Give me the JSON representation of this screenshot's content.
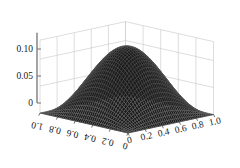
{
  "figure": {
    "kind": "surface-plot-3d",
    "background_color": "#ffffff",
    "width": 240,
    "height": 168
  },
  "chart_data": {
    "type": "surface",
    "title": "",
    "subtitle": "",
    "xlabel": "",
    "ylabel": "",
    "zlabel": "",
    "grid": true,
    "legend": "none",
    "xlim": [
      0,
      1
    ],
    "ylim": [
      0,
      1
    ],
    "zlim": [
      0,
      0.125
    ],
    "x_ticks": [
      "0",
      "0.2",
      "0.4",
      "0.6",
      "0.8",
      "1.0"
    ],
    "x_tick_values": [
      0,
      0.2,
      0.4,
      0.6,
      0.8,
      1.0
    ],
    "y_ticks": [
      "1.0",
      "0.8",
      "0.6",
      "0.4",
      "0.2",
      "0"
    ],
    "y_tick_values": [
      1.0,
      0.8,
      0.6,
      0.4,
      0.2,
      0
    ],
    "z_ticks": [
      "0",
      "0.05",
      "0.10"
    ],
    "z_tick_values": [
      0,
      0.05,
      0.1
    ],
    "peak_value": 0.125,
    "peak_x": 0.5,
    "peak_y": 0.5,
    "boundary_value": 0,
    "surface_color": "#1c1c1c",
    "mesh_color": "#6e6e6e",
    "grid_color": "#cfcfcf",
    "axis_color": "#7d7d7d",
    "x": [
      0,
      0.05,
      0.1,
      0.15,
      0.2,
      0.25,
      0.3,
      0.35,
      0.4,
      0.45,
      0.5,
      0.55,
      0.6,
      0.65,
      0.7,
      0.75,
      0.8,
      0.85,
      0.9,
      0.95,
      1.0
    ],
    "y": [
      0,
      0.05,
      0.1,
      0.15,
      0.2,
      0.25,
      0.3,
      0.35,
      0.4,
      0.45,
      0.5,
      0.55,
      0.6,
      0.65,
      0.7,
      0.75,
      0.8,
      0.85,
      0.9,
      0.95,
      1.0
    ],
    "z_formula": "0.5 * sin(pi*x) * sin(pi*y) * 0.25",
    "z_rows": [
      [
        0,
        0,
        0,
        0,
        0,
        0,
        0,
        0,
        0,
        0,
        0,
        0,
        0,
        0,
        0,
        0,
        0,
        0,
        0,
        0,
        0
      ],
      [
        0,
        0.003,
        0.006,
        0.009,
        0.011,
        0.013,
        0.015,
        0.017,
        0.018,
        0.019,
        0.019,
        0.019,
        0.018,
        0.017,
        0.015,
        0.013,
        0.011,
        0.009,
        0.006,
        0.003,
        0
      ],
      [
        0,
        0.006,
        0.012,
        0.017,
        0.022,
        0.026,
        0.03,
        0.033,
        0.035,
        0.037,
        0.038,
        0.037,
        0.035,
        0.033,
        0.03,
        0.026,
        0.022,
        0.017,
        0.012,
        0.006,
        0
      ],
      [
        0,
        0.009,
        0.017,
        0.025,
        0.032,
        0.038,
        0.043,
        0.047,
        0.05,
        0.053,
        0.054,
        0.053,
        0.05,
        0.047,
        0.043,
        0.038,
        0.032,
        0.025,
        0.017,
        0.009,
        0
      ],
      [
        0,
        0.011,
        0.022,
        0.032,
        0.04,
        0.048,
        0.055,
        0.06,
        0.064,
        0.067,
        0.068,
        0.067,
        0.064,
        0.06,
        0.055,
        0.048,
        0.04,
        0.032,
        0.022,
        0.011,
        0
      ],
      [
        0,
        0.013,
        0.026,
        0.038,
        0.048,
        0.058,
        0.065,
        0.072,
        0.076,
        0.079,
        0.08,
        0.079,
        0.076,
        0.072,
        0.065,
        0.058,
        0.048,
        0.038,
        0.026,
        0.013,
        0
      ],
      [
        0,
        0.015,
        0.03,
        0.043,
        0.055,
        0.065,
        0.074,
        0.081,
        0.086,
        0.09,
        0.091,
        0.09,
        0.086,
        0.081,
        0.074,
        0.065,
        0.055,
        0.043,
        0.03,
        0.015,
        0
      ],
      [
        0,
        0.017,
        0.033,
        0.047,
        0.06,
        0.072,
        0.081,
        0.089,
        0.095,
        0.098,
        0.1,
        0.098,
        0.095,
        0.089,
        0.081,
        0.072,
        0.06,
        0.047,
        0.033,
        0.017,
        0
      ],
      [
        0,
        0.018,
        0.035,
        0.05,
        0.064,
        0.076,
        0.086,
        0.095,
        0.1,
        0.104,
        0.106,
        0.104,
        0.1,
        0.095,
        0.086,
        0.076,
        0.064,
        0.05,
        0.035,
        0.018,
        0
      ],
      [
        0,
        0.019,
        0.037,
        0.053,
        0.067,
        0.079,
        0.09,
        0.098,
        0.104,
        0.109,
        0.11,
        0.109,
        0.104,
        0.098,
        0.09,
        0.079,
        0.067,
        0.053,
        0.037,
        0.019,
        0
      ],
      [
        0,
        0.019,
        0.038,
        0.054,
        0.068,
        0.08,
        0.091,
        0.1,
        0.106,
        0.11,
        0.125,
        0.11,
        0.106,
        0.1,
        0.091,
        0.08,
        0.068,
        0.054,
        0.038,
        0.019,
        0
      ],
      [
        0,
        0.019,
        0.037,
        0.053,
        0.067,
        0.079,
        0.09,
        0.098,
        0.104,
        0.109,
        0.11,
        0.109,
        0.104,
        0.098,
        0.09,
        0.079,
        0.067,
        0.053,
        0.037,
        0.019,
        0
      ],
      [
        0,
        0.018,
        0.035,
        0.05,
        0.064,
        0.076,
        0.086,
        0.095,
        0.1,
        0.104,
        0.106,
        0.104,
        0.1,
        0.095,
        0.086,
        0.076,
        0.064,
        0.05,
        0.035,
        0.018,
        0
      ],
      [
        0,
        0.017,
        0.033,
        0.047,
        0.06,
        0.072,
        0.081,
        0.089,
        0.095,
        0.098,
        0.1,
        0.098,
        0.095,
        0.089,
        0.081,
        0.072,
        0.06,
        0.047,
        0.033,
        0.017,
        0
      ],
      [
        0,
        0.015,
        0.03,
        0.043,
        0.055,
        0.065,
        0.074,
        0.081,
        0.086,
        0.09,
        0.091,
        0.09,
        0.086,
        0.081,
        0.074,
        0.065,
        0.055,
        0.043,
        0.03,
        0.015,
        0
      ],
      [
        0,
        0.013,
        0.026,
        0.038,
        0.048,
        0.058,
        0.065,
        0.072,
        0.076,
        0.079,
        0.08,
        0.079,
        0.076,
        0.072,
        0.065,
        0.058,
        0.048,
        0.038,
        0.026,
        0.013,
        0
      ],
      [
        0,
        0.011,
        0.022,
        0.032,
        0.04,
        0.048,
        0.055,
        0.06,
        0.064,
        0.067,
        0.068,
        0.067,
        0.064,
        0.06,
        0.055,
        0.048,
        0.04,
        0.032,
        0.022,
        0.011,
        0
      ],
      [
        0,
        0.009,
        0.017,
        0.025,
        0.032,
        0.038,
        0.043,
        0.047,
        0.05,
        0.053,
        0.054,
        0.053,
        0.05,
        0.047,
        0.043,
        0.038,
        0.032,
        0.025,
        0.017,
        0.009,
        0
      ],
      [
        0,
        0.006,
        0.012,
        0.017,
        0.022,
        0.026,
        0.03,
        0.033,
        0.035,
        0.037,
        0.038,
        0.037,
        0.035,
        0.033,
        0.03,
        0.026,
        0.022,
        0.017,
        0.012,
        0.006,
        0
      ],
      [
        0,
        0.003,
        0.006,
        0.009,
        0.011,
        0.013,
        0.015,
        0.017,
        0.018,
        0.019,
        0.019,
        0.019,
        0.018,
        0.017,
        0.015,
        0.013,
        0.011,
        0.009,
        0.006,
        0.003,
        0
      ],
      [
        0,
        0,
        0,
        0,
        0,
        0,
        0,
        0,
        0,
        0,
        0,
        0,
        0,
        0,
        0,
        0,
        0,
        0,
        0,
        0,
        0
      ]
    ]
  },
  "axes": {
    "z_axis": {
      "name": "vertical-value-axis",
      "ticks": [
        {
          "label": "0.10",
          "value": 0.1
        },
        {
          "label": "0.05",
          "value": 0.05
        },
        {
          "label": "0",
          "value": 0
        }
      ]
    },
    "y_axis": {
      "name": "left-depth-axis",
      "ticks": [
        {
          "label": "1.0",
          "value": 1.0
        },
        {
          "label": "0.8",
          "value": 0.8
        },
        {
          "label": "0.6",
          "value": 0.6
        },
        {
          "label": "0.4",
          "value": 0.4
        },
        {
          "label": "0.2",
          "value": 0.2
        },
        {
          "label": "0",
          "value": 0
        }
      ]
    },
    "x_axis": {
      "name": "right-horizontal-axis",
      "ticks": [
        {
          "label": "0",
          "value": 0
        },
        {
          "label": "0.2",
          "value": 0.2
        },
        {
          "label": "0.4",
          "value": 0.4
        },
        {
          "label": "0.6",
          "value": 0.6
        },
        {
          "label": "0.8",
          "value": 0.8
        },
        {
          "label": "1.0",
          "value": 1.0
        }
      ]
    }
  }
}
